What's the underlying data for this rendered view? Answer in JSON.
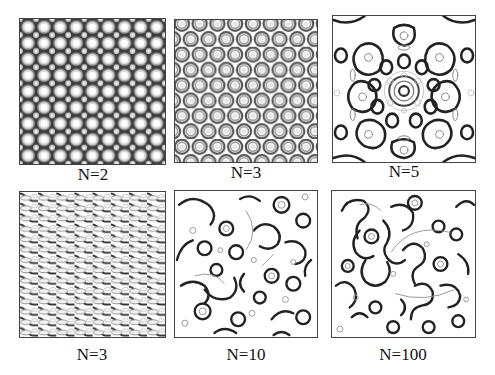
{
  "figure": {
    "panels": [
      {
        "id": "p1",
        "label": "N=2",
        "pattern": "square-lattice-spots"
      },
      {
        "id": "p2",
        "label": "N=3",
        "pattern": "hexagonal-rings"
      },
      {
        "id": "p3",
        "label": "N=5",
        "pattern": "quasicrystal-5fold"
      },
      {
        "id": "p4",
        "label": "N=3",
        "pattern": "oblique-stripes"
      },
      {
        "id": "p5",
        "label": "N=10",
        "pattern": "disordered-quasi-10fold"
      },
      {
        "id": "p6",
        "label": "N=100",
        "pattern": "disordered-labyrinth"
      }
    ]
  }
}
